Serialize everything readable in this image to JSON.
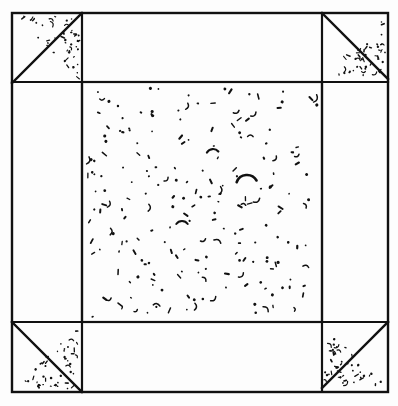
{
  "figure": {
    "kind": "technical-line-drawing",
    "canvas": {
      "width": 398,
      "height": 406
    },
    "colors": {
      "background": "#fdfdfd",
      "ink": "#111111",
      "page": "#ffffff"
    },
    "outer_frame": {
      "name": "outer-frame",
      "x": 12,
      "y": 13,
      "width": 376,
      "height": 379,
      "stroke_width": 2.4
    },
    "center_region": {
      "name": "center-stipple-region",
      "x": 82,
      "y": 82,
      "width": 240,
      "height": 240,
      "stroke_width": 2.2,
      "stipple_count": 214,
      "description": "dense speckled / stippled square"
    },
    "corner_cells": [
      {
        "name": "corner-cell-top-left",
        "x": 12,
        "y": 13,
        "size": 70,
        "diagonal": "bottom-left-to-top-right",
        "stipple_side": "lower-right",
        "stipple_count": 46
      },
      {
        "name": "corner-cell-top-right",
        "x": 322,
        "y": 13,
        "size": 66,
        "diagonal": "top-left-to-bottom-right",
        "stipple_side": "lower-left",
        "stipple_count": 46
      },
      {
        "name": "corner-cell-bottom-left",
        "x": 12,
        "y": 322,
        "size": 70,
        "diagonal": "top-left-to-bottom-right",
        "stipple_side": "upper-right",
        "stipple_count": 46
      },
      {
        "name": "corner-cell-bottom-right",
        "x": 322,
        "y": 322,
        "size": 66,
        "diagonal": "bottom-left-to-top-right",
        "stipple_side": "upper-left",
        "stipple_count": 46
      }
    ],
    "grid_lines": [
      {
        "name": "grid-line-top-horizontal",
        "x1": 12,
        "y1": 82,
        "x2": 388,
        "y2": 82
      },
      {
        "name": "grid-line-bottom-horizontal",
        "x1": 12,
        "y1": 322,
        "x2": 388,
        "y2": 322
      },
      {
        "name": "grid-line-left-vertical",
        "x1": 82,
        "y1": 13,
        "x2": 82,
        "y2": 392
      },
      {
        "name": "grid-line-right-vertical",
        "x1": 322,
        "y1": 13,
        "x2": 322,
        "y2": 392
      }
    ],
    "arc_marks": [
      {
        "name": "arc-mark-center",
        "cx": 247,
        "cy": 186,
        "r": 11,
        "start_deg": 200,
        "end_deg": 330,
        "stroke_width": 2.6
      },
      {
        "name": "arc-mark-upper",
        "cx": 213,
        "cy": 156,
        "r": 7,
        "start_deg": 210,
        "end_deg": 320,
        "stroke_width": 2.2
      },
      {
        "name": "arc-mark-lower",
        "cx": 182,
        "cy": 228,
        "r": 7,
        "start_deg": 215,
        "end_deg": 325,
        "stroke_width": 2.0
      }
    ]
  }
}
